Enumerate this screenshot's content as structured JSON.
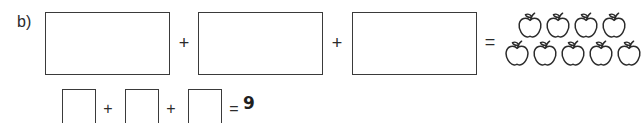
{
  "worksheet": {
    "part_label": "b)",
    "answer_value": "9",
    "ink_color": "#3a3a3a",
    "background_color": "#ffffff",
    "equation_row": {
      "boxes": [
        {
          "id": "big-box-1",
          "value": ""
        },
        {
          "id": "big-box-2",
          "value": ""
        },
        {
          "id": "big-box-3",
          "value": ""
        }
      ],
      "operators": [
        "+",
        "+",
        "="
      ],
      "plus_1": "+",
      "plus_2": "+",
      "equals": "="
    },
    "number_sentence_row": {
      "boxes": [
        {
          "id": "small-box-1",
          "value": ""
        },
        {
          "id": "small-box-2",
          "value": ""
        },
        {
          "id": "small-box-3",
          "value": ""
        }
      ],
      "plus_1": "+",
      "plus_2": "+",
      "equals": "=",
      "result": "9"
    },
    "apple_group": {
      "icon_name": "apple-icon",
      "total_count": 9,
      "rows": [
        {
          "count": 4
        },
        {
          "count": 5
        }
      ]
    }
  }
}
